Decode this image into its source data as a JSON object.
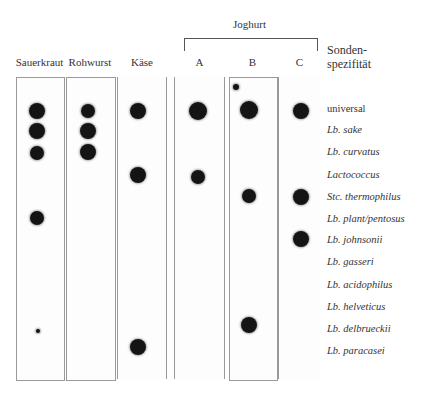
{
  "figure": {
    "group_label": "Joghurt",
    "probe_header_line1": "Sonden-",
    "probe_header_line2": "spezifität",
    "columns": [
      {
        "label": "Sauerkraut",
        "x": 16,
        "w": 47
      },
      {
        "label": "Rohwurst",
        "x": 66,
        "w": 48
      },
      {
        "label": "Käse",
        "x": 118,
        "w": 48
      },
      {
        "label": "A",
        "x": 175,
        "w": 49
      },
      {
        "label": "B",
        "x": 229,
        "w": 47
      },
      {
        "label": "C",
        "x": 279,
        "w": 41
      }
    ],
    "probes": [
      {
        "label": "universal",
        "italic": false,
        "y": 110
      },
      {
        "label": "Lb. sake",
        "italic": true,
        "y": 131
      },
      {
        "label": "Lb. curvatus",
        "italic": true,
        "y": 153
      },
      {
        "label": "Lactococcus",
        "italic": true,
        "y": 176
      },
      {
        "label": "Stc. thermophilus",
        "italic": true,
        "y": 198
      },
      {
        "label": "Lb. plant/pentosus",
        "italic": true,
        "y": 220
      },
      {
        "label": "Lb. johnsonii",
        "italic": true,
        "y": 241
      },
      {
        "label": "Lb. gasseri",
        "italic": true,
        "y": 263
      },
      {
        "label": "Lb. acidophilus",
        "italic": true,
        "y": 286
      },
      {
        "label": "Lb. helveticus",
        "italic": true,
        "y": 308
      },
      {
        "label": "Lb. delbrueckii",
        "italic": true,
        "y": 330
      },
      {
        "label": "Lb. paracasei",
        "italic": true,
        "y": 352
      }
    ],
    "hybridization_signals": {
      "Sauerkraut": [
        "universal",
        "Lb. sake",
        "Lb. curvatus",
        "Lb. plant/pentosus"
      ],
      "Rohwurst": [
        "universal",
        "Lb. sake",
        "Lb. curvatus"
      ],
      "Käse": [
        "universal",
        "Lactococcus",
        "Lb. paracasei"
      ],
      "A": [
        "universal",
        "Lactococcus"
      ],
      "B": [
        "universal",
        "Stc. thermophilus",
        "Lb. delbrueckii"
      ],
      "C": [
        "universal",
        "Stc. thermophilus",
        "Lb. johnsonii"
      ]
    },
    "dots": [
      {
        "col": "Sauerkraut",
        "cx": 37,
        "cy": 111,
        "r": 8
      },
      {
        "col": "Sauerkraut",
        "cx": 37,
        "cy": 131,
        "r": 8
      },
      {
        "col": "Sauerkraut",
        "cx": 37,
        "cy": 153,
        "r": 7
      },
      {
        "col": "Sauerkraut",
        "cx": 37,
        "cy": 218,
        "r": 7
      },
      {
        "col": "Sauerkraut",
        "cx": 38,
        "cy": 331,
        "r": 2
      },
      {
        "col": "Rohwurst",
        "cx": 88,
        "cy": 111,
        "r": 7
      },
      {
        "col": "Rohwurst",
        "cx": 88,
        "cy": 131,
        "r": 8
      },
      {
        "col": "Rohwurst",
        "cx": 88,
        "cy": 152,
        "r": 8
      },
      {
        "col": "Käse",
        "cx": 138,
        "cy": 111,
        "r": 8
      },
      {
        "col": "Käse",
        "cx": 138,
        "cy": 175,
        "r": 8
      },
      {
        "col": "Käse",
        "cx": 138,
        "cy": 347,
        "r": 8
      },
      {
        "col": "A",
        "cx": 198,
        "cy": 111,
        "r": 9
      },
      {
        "col": "A",
        "cx": 198,
        "cy": 177,
        "r": 7
      },
      {
        "col": "B",
        "cx": 236,
        "cy": 87,
        "r": 3
      },
      {
        "col": "B",
        "cx": 249,
        "cy": 110,
        "r": 9
      },
      {
        "col": "B",
        "cx": 249,
        "cy": 196,
        "r": 7
      },
      {
        "col": "B",
        "cx": 249,
        "cy": 325,
        "r": 8
      },
      {
        "col": "C",
        "cx": 301,
        "cy": 111,
        "r": 8
      },
      {
        "col": "C",
        "cx": 301,
        "cy": 197,
        "r": 8
      },
      {
        "col": "C",
        "cx": 301,
        "cy": 239,
        "r": 8
      }
    ]
  }
}
